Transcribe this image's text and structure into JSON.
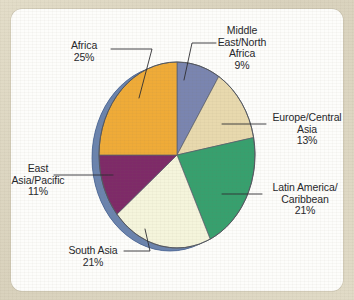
{
  "page": {
    "background_color": "#ded8c4",
    "panel_color": "#fdfdfb"
  },
  "chart_data": {
    "type": "pie",
    "title": "",
    "subtitle": "",
    "xlabel": "",
    "ylabel": "",
    "legend_position": "callout-labels",
    "grid": false,
    "start_angle_deg": 0,
    "direction": "clockwise",
    "categories": [
      "Middle East/North Africa",
      "Europe/Central Asia",
      "Latin America/Caribbean",
      "South Asia",
      "East Asia/Pacific",
      "Africa"
    ],
    "values": [
      9,
      13,
      21,
      21,
      11,
      25
    ],
    "value_labels": [
      "9%",
      "13%",
      "21%",
      "21%",
      "11%",
      "25%"
    ],
    "colors": [
      "#7a85b0",
      "#e8d9ae",
      "#37a06e",
      "#f5f5dc",
      "#7e2a68",
      "#efab38"
    ],
    "depth_color": "#5f7ba8",
    "slice_outline_color": "#5a5f6b"
  },
  "labels": {
    "middle_east": {
      "line1": "Middle",
      "line2": "East/North",
      "line3": "Africa",
      "percent": "9%"
    },
    "europe": {
      "line1": "Europe/Central",
      "line2": "Asia",
      "percent": "13%"
    },
    "latin_america": {
      "line1": "Latin America/",
      "line2": "Caribbean",
      "percent": "21%"
    },
    "south_asia": {
      "line1": "South Asia",
      "percent": "21%"
    },
    "east_asia": {
      "line1": "East",
      "line2": "Asia/Pacific",
      "percent": "11%"
    },
    "africa": {
      "line1": "Africa",
      "percent": "25%"
    }
  }
}
